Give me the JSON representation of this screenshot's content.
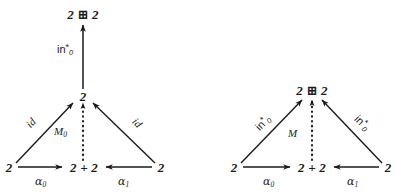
{
  "figure": {
    "kind": "commutative-diagram-pair",
    "background_color": "#ffffff",
    "ink_color": "#1a1a1a",
    "left_diagram": {
      "name": "left-commutative-diagram",
      "nodes": {
        "top": "2 ⊞ 2",
        "apex": "2",
        "bottom_left": "2",
        "bottom_mid": "2 + 2",
        "bottom_right": "2"
      },
      "top_vertical_arrow_label": "in",
      "top_vertical_arrow_sub": "0",
      "top_vertical_arrow_sup": "*",
      "left_diagonal_label": "id",
      "right_diagonal_label": "id",
      "dotted_label": "M",
      "dotted_label_sub": "0",
      "bottom_left_arrow_label": "α",
      "bottom_left_arrow_sub": "0",
      "bottom_right_arrow_label": "α",
      "bottom_right_arrow_sub": "1"
    },
    "right_diagram": {
      "name": "right-commutative-diagram",
      "nodes": {
        "apex": "2 ⊞ 2",
        "bottom_left": "2",
        "bottom_mid": "2 + 2",
        "bottom_right": "2"
      },
      "left_diagonal_label": "in",
      "left_diagonal_sub": "0",
      "left_diagonal_sup": "*",
      "right_diagonal_label": "in",
      "right_diagonal_sub": "0",
      "right_diagonal_sup": "*",
      "dotted_label": "M",
      "bottom_left_arrow_label": "α",
      "bottom_left_arrow_sub": "0",
      "bottom_right_arrow_label": "α",
      "bottom_right_arrow_sub": "1"
    }
  }
}
